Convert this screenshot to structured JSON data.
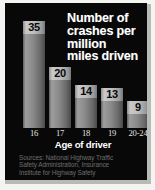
{
  "chart_data": {
    "type": "bar",
    "title": "Number of crashes per million miles driven",
    "title_lines": [
      "Number of",
      "crashes per",
      "million",
      "miles driven"
    ],
    "xlabel": "Age of driver",
    "ylabel": "",
    "categories": [
      "16",
      "17",
      "18",
      "19",
      "20-24"
    ],
    "values": [
      35,
      20,
      14,
      13,
      9
    ],
    "ylim": [
      0,
      37
    ],
    "grid": false,
    "legend": null,
    "value_labels_shown": true,
    "bar_color": "#9a9a9a",
    "background_color": "#080808",
    "text_color": "#ffffff",
    "source_note": "Sources: National Highway Traffic Safety Administration, Insurance Institute for Highway Safety",
    "source_lines": [
      "Sources: National Highway Traffic",
      "Safety Administration, Insurance",
      "Institute for Highway Safety"
    ]
  }
}
